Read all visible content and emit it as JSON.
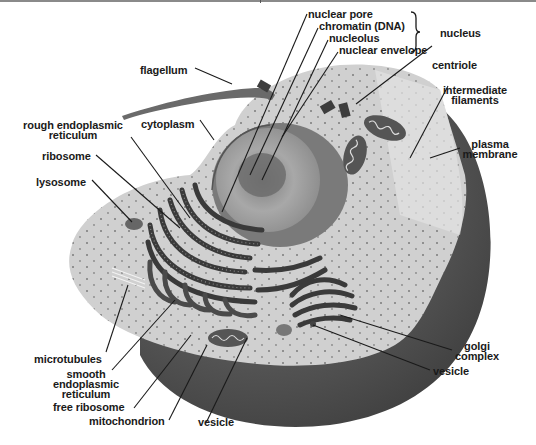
{
  "diagram": {
    "labels": {
      "nuclear_pore": "nuclear pore",
      "chromatin": "chromatin (DNA)",
      "nucleolus": "nucleolus",
      "nuclear_envelope": "nuclear envelope",
      "nucleus": "nucleus",
      "centriole": "centriole",
      "flagellum": "flagellum",
      "intermediate_filaments_1": "intermediate",
      "intermediate_filaments_2": "filaments",
      "rough_er_1": "rough endoplasmic",
      "rough_er_2": "reticulum",
      "cytoplasm": "cytoplasm",
      "plasma_membrane_1": "plasma",
      "plasma_membrane_2": "membrane",
      "ribosome": "ribosome",
      "lysosome": "lysosome",
      "golgi_1": "golgi",
      "golgi_2": "complex",
      "vesicle_right": "vesicle",
      "microtubules": "microtubules",
      "smooth_er_1": "smooth",
      "smooth_er_2": "endoplasmic",
      "smooth_er_3": "reticulum",
      "free_ribosome": "free ribosome",
      "mitochondrion": "mitochondrion",
      "vesicle_bottom": "vesicle"
    },
    "colors": {
      "background": "#ffffff",
      "cytoplasm": "#cfcfcf",
      "outer_shell": "#555555",
      "nucleus": "#9a9a9a",
      "organelle_dark": "#3c3c3c",
      "text": "#1a1a1a"
    }
  }
}
